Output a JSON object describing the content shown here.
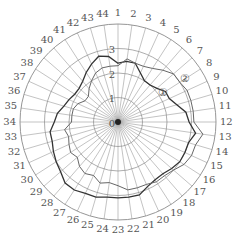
{
  "chart_data": {
    "type": "radar",
    "title": "",
    "axes": [
      "1",
      "2",
      "3",
      "4",
      "5",
      "6",
      "7",
      "8",
      "9",
      "10",
      "11",
      "12",
      "13",
      "14",
      "15",
      "16",
      "17",
      "18",
      "19",
      "20",
      "21",
      "22",
      "23",
      "24",
      "25",
      "26",
      "27",
      "28",
      "29",
      "30",
      "31",
      "32",
      "33",
      "34",
      "35",
      "36",
      "37",
      "38",
      "39",
      "40",
      "41",
      "42",
      "43",
      "44"
    ],
    "radial_ticks": [
      "0",
      "1",
      "2",
      "3"
    ],
    "rmax": 4,
    "grid": true,
    "series": [
      {
        "name": "①",
        "color": "#333333",
        "values": [
          2.4,
          2.5,
          2.5,
          2.2,
          2.0,
          2.0,
          2.1,
          2.3,
          2.3,
          2.5,
          2.8,
          2.9,
          3.2,
          3.0,
          3.0,
          3.0,
          2.9,
          2.8,
          2.8,
          2.9,
          3.1,
          3.1,
          3.1,
          3.1,
          3.2,
          3.2,
          3.3,
          3.3,
          3.1,
          3.0,
          2.9,
          2.8,
          2.8,
          2.6,
          2.5,
          2.3,
          2.2,
          2.1,
          2.1,
          2.2,
          2.4,
          2.6,
          2.8,
          2.7
        ]
      },
      {
        "name": "②",
        "color": "#666666",
        "values": [
          2.3,
          2.6,
          2.5,
          2.5,
          2.6,
          2.8,
          3.0,
          3.0,
          3.1,
          3.1,
          3.1,
          3.1,
          3.5,
          3.3,
          3.3,
          3.2,
          3.0,
          2.9,
          2.9,
          2.8,
          2.8,
          2.8,
          2.6,
          2.5,
          2.6,
          2.4,
          2.5,
          2.4,
          2.2,
          2.3,
          2.2,
          2.1,
          2.2,
          1.9,
          1.9,
          1.9,
          1.8,
          1.6,
          1.6,
          1.8,
          2.0,
          2.2,
          2.3,
          2.3
        ]
      }
    ],
    "series_labels": [
      {
        "text": "①",
        "axis": 8,
        "r": 2.2
      },
      {
        "text": "②",
        "axis": 8,
        "r": 3.25
      }
    ]
  }
}
